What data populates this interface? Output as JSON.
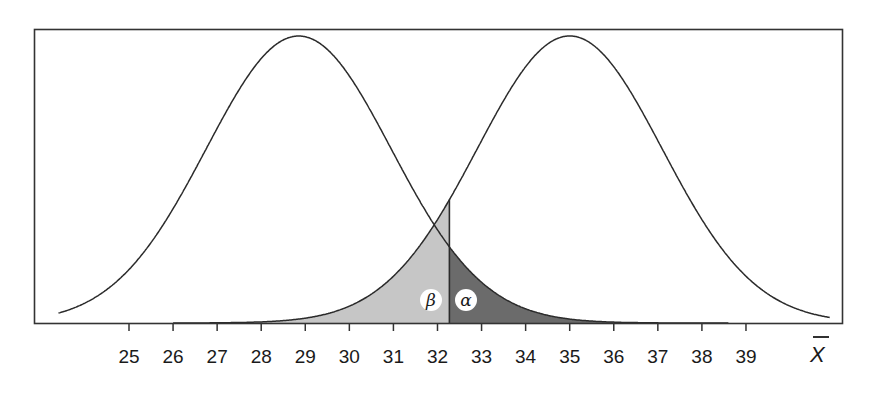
{
  "chart_data": {
    "type": "area",
    "title": "",
    "xlabel": "X̄",
    "ylabel": "",
    "xlim": [
      23.0,
      41.5
    ],
    "grid": false,
    "legend": null,
    "x_ticks": [
      25,
      26,
      27,
      28,
      29,
      30,
      31,
      32,
      33,
      34,
      35,
      36,
      37,
      38,
      39
    ],
    "series": [
      {
        "name": "left distribution",
        "shape": "normal",
        "mean": 28.85,
        "sd": 2.1,
        "x_range": [
          23.4,
          38.6
        ]
      },
      {
        "name": "right distribution",
        "shape": "normal",
        "mean": 35.0,
        "sd": 2.1,
        "x_range": [
          26.0,
          40.9
        ]
      }
    ],
    "critical_value": 32.27,
    "shaded_regions": [
      {
        "label": "β",
        "under": "right distribution",
        "from": 26.0,
        "to": 32.27,
        "color": "#c6c6c6"
      },
      {
        "label": "α",
        "under": "left distribution",
        "from": 32.27,
        "to": 38.6,
        "color": "#6b6b6b"
      }
    ],
    "annotations": [
      {
        "text": "β",
        "x": 32.0,
        "position": "left of critical value"
      },
      {
        "text": "α",
        "x": 32.8,
        "position": "right of critical value"
      }
    ]
  },
  "colors": {
    "line": "#2b2b2b",
    "beta_fill": "#c6c6c6",
    "alpha_fill": "#6b6b6b",
    "frame": "#333333"
  }
}
